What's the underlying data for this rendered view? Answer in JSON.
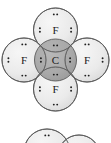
{
  "figure": {
    "kind": "lewis-structure-overlapping-shells",
    "molecule": "CF4",
    "background_color": "#ffffff",
    "outline_color": "#5a5a5a",
    "shell_fill_light": "#e8e8e8",
    "shell_fill_overlap": "#9b9b9b",
    "shell_fill_center": "#8e8e8e",
    "dot_color": "#1f1f1f",
    "label_color": "#1a1a1a"
  },
  "primary_structure": {
    "center_atom": {
      "symbol": "C",
      "name": "carbon-center",
      "cx": 55.5,
      "cy": 60,
      "r": 21,
      "electron_groups": [
        {
          "position": "top",
          "orientation": "horizontal",
          "count": 2
        },
        {
          "position": "bottom",
          "orientation": "horizontal",
          "count": 2
        },
        {
          "position": "left",
          "orientation": "vertical",
          "count": 2
        },
        {
          "position": "right",
          "orientation": "vertical",
          "count": 2
        }
      ]
    },
    "outer_atoms": [
      {
        "symbol": "F",
        "name": "fluorine-top",
        "cx": 55.5,
        "cy": 30,
        "r": 22,
        "electron_groups": [
          {
            "position": "top",
            "orientation": "horizontal",
            "count": 2
          },
          {
            "position": "left",
            "orientation": "vertical",
            "count": 2
          },
          {
            "position": "right",
            "orientation": "vertical",
            "count": 2
          }
        ]
      },
      {
        "symbol": "F",
        "name": "fluorine-left",
        "cx": 24,
        "cy": 60,
        "r": 22,
        "electron_groups": [
          {
            "position": "top",
            "orientation": "horizontal",
            "count": 2
          },
          {
            "position": "bottom",
            "orientation": "horizontal",
            "count": 2
          },
          {
            "position": "left",
            "orientation": "vertical",
            "count": 2
          }
        ]
      },
      {
        "symbol": "F",
        "name": "fluorine-right",
        "cx": 87,
        "cy": 60,
        "r": 22,
        "electron_groups": [
          {
            "position": "top",
            "orientation": "horizontal",
            "count": 2
          },
          {
            "position": "bottom",
            "orientation": "horizontal",
            "count": 2
          },
          {
            "position": "right",
            "orientation": "vertical",
            "count": 2
          }
        ]
      },
      {
        "symbol": "F",
        "name": "fluorine-bottom",
        "cx": 55.5,
        "cy": 89,
        "r": 22,
        "electron_groups": [
          {
            "position": "bottom",
            "orientation": "horizontal",
            "count": 2
          },
          {
            "position": "left",
            "orientation": "vertical",
            "count": 2
          },
          {
            "position": "right",
            "orientation": "vertical",
            "count": 2
          }
        ]
      }
    ]
  },
  "secondary_structure": {
    "note_name": "partial-second-diagram",
    "circles": [
      {
        "name": "partial-circle-left",
        "cx": 47,
        "cy": 152,
        "r": 23,
        "electron_groups": [
          {
            "position": "top",
            "orientation": "horizontal",
            "count": 2
          }
        ]
      },
      {
        "name": "partial-circle-right",
        "cx": 79,
        "cy": 156,
        "r": 21,
        "electron_groups": []
      }
    ]
  },
  "labels": {
    "carbon": "C",
    "fluorine": "F"
  }
}
